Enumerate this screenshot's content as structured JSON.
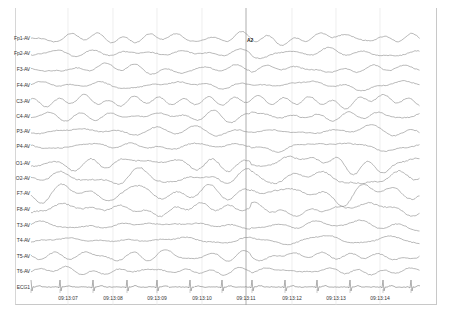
{
  "viewer": {
    "channels": [
      {
        "label": "Fp1-AV",
        "y": 38
      },
      {
        "label": "Fp2-AV",
        "y": 53
      },
      {
        "label": "F3-AV",
        "y": 69
      },
      {
        "label": "F4-AV",
        "y": 85
      },
      {
        "label": "C3-AV",
        "y": 101
      },
      {
        "label": "C4-AV",
        "y": 116
      },
      {
        "label": "P3-AV",
        "y": 131
      },
      {
        "label": "P4-AV",
        "y": 146
      },
      {
        "label": "O1-AV",
        "y": 163
      },
      {
        "label": "O2-AV",
        "y": 178
      },
      {
        "label": "F7-AV",
        "y": 193
      },
      {
        "label": "F8-AV",
        "y": 209
      },
      {
        "label": "T3-AV",
        "y": 225
      },
      {
        "label": "T4-AV",
        "y": 240
      },
      {
        "label": "T5-AV",
        "y": 256
      },
      {
        "label": "T6-AV",
        "y": 271
      },
      {
        "label": "ECG1",
        "y": 287
      }
    ],
    "time_labels": [
      {
        "label": "09:13:07",
        "x": 68
      },
      {
        "label": "09:13:08",
        "x": 113
      },
      {
        "label": "09:13:09",
        "x": 157
      },
      {
        "label": "09:13:10",
        "x": 202
      },
      {
        "label": "09:13:11",
        "x": 246
      },
      {
        "label": "09:13:12",
        "x": 292
      },
      {
        "label": "09:13:13",
        "x": 336
      },
      {
        "label": "09:13:14",
        "x": 380
      }
    ],
    "marker": {
      "label": "A2",
      "x": 246,
      "y": 40
    },
    "ecg_r_peaks": [
      31,
      60,
      93,
      127,
      157,
      190,
      222,
      252,
      285,
      317,
      350,
      383,
      411
    ],
    "colors": {
      "trace": "#8a8a8a",
      "grid": "#e2e2e2",
      "marker_line": "#9a9a9a",
      "ecg": "#7a7a7a"
    }
  }
}
